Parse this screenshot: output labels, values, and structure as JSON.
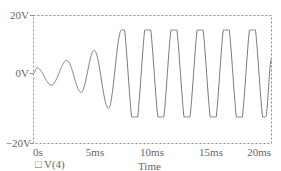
{
  "chart_data": {
    "type": "line",
    "title": "",
    "xlabel": "Time",
    "ylabel": "",
    "xlim": [
      0,
      20
    ],
    "ylim": [
      -20,
      20
    ],
    "x_unit": "ms",
    "x_ticks": [
      "0s",
      "5ms",
      "10ms",
      "15ms",
      "20ms"
    ],
    "y_ticks": [
      "20V",
      "0V",
      "-20V"
    ],
    "grid": false,
    "legend": [
      {
        "marker": "□",
        "label": "V(4)"
      }
    ],
    "series": [
      {
        "name": "V(4)",
        "description": "Growing oscillation that saturates (clips) at about ±15V after ~8ms; period ≈ 2.2ms",
        "x": [
          0,
          0.3,
          1.5,
          2.8,
          4.0,
          5.1,
          6.3,
          7.4,
          8.5,
          9.6,
          10.7,
          11.8,
          12.9,
          14.0,
          15.1,
          16.2,
          17.3,
          18.4,
          19.5,
          20.0
        ],
        "values": [
          0,
          2,
          -4,
          4.5,
          -6.5,
          8,
          -12,
          15,
          -15,
          15,
          -15,
          15,
          -15,
          15,
          -15,
          15,
          -15,
          15,
          -15,
          5
        ]
      }
    ],
    "clip_level": 15
  },
  "labels": {
    "y_top": "20V",
    "y_mid": "0V",
    "y_bot": "−20V",
    "x0": "0s",
    "x1": "5ms",
    "x2": "10ms",
    "x3": "15ms",
    "x4": "20ms",
    "xlabel": "Time",
    "legend_marker": "□",
    "legend_label": "V(4)"
  },
  "colors": {
    "trace": "#7a7a7a",
    "frame": "#8c8c8c",
    "text": "#666666"
  }
}
